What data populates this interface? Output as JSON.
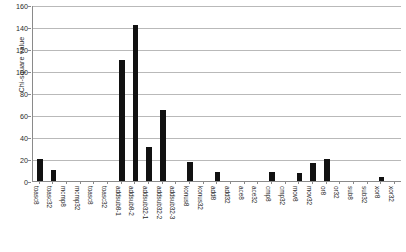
{
  "chart_data": {
    "type": "bar",
    "title": "",
    "xlabel": "",
    "ylabel": "Chi-square value",
    "ylim": [
      0,
      160
    ],
    "ytick_values": [
      0,
      20,
      40,
      60,
      80,
      100,
      120,
      140,
      160
    ],
    "ytick_labels": [
      "0",
      "20",
      "40",
      "60",
      "80",
      "100",
      "120",
      "140",
      "160"
    ],
    "grid": true,
    "legend": "none",
    "bar_color": "#111111",
    "categories": [
      "toasc8",
      "toasc32",
      "mcmp8",
      "mcmp32",
      "toasc8",
      "toasc32",
      "addsub8-1",
      "addsub8-2",
      "addsub32-1",
      "addsub32-2",
      "addsub32-3",
      "konus8",
      "konus32",
      "add8",
      "add32",
      "ace8",
      "ace32",
      "cmp8",
      "cmp32",
      "mov8",
      "mov32",
      "or8",
      "or32",
      "sub8",
      "sub32",
      "xor8",
      "xor32"
    ],
    "values": [
      20,
      10,
      0,
      0,
      0,
      0,
      110,
      142,
      31,
      65,
      0,
      17,
      0,
      8,
      0,
      0,
      0,
      8,
      0,
      7,
      16,
      20,
      0,
      0,
      0,
      4,
      0
    ]
  },
  "axis": {
    "y_title": "Chi-square value"
  }
}
